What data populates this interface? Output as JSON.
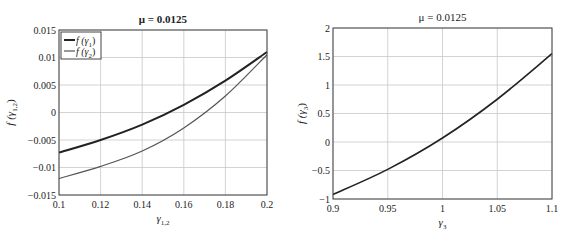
{
  "chart_data": [
    {
      "type": "line",
      "title": "μ = 0.0125",
      "xlabel": "γ1,2",
      "ylabel": "f (γ1,2)",
      "xlim": [
        0.1,
        0.2
      ],
      "ylim": [
        -0.015,
        0.015
      ],
      "grid": true,
      "legend_position": "upper left",
      "x_ticks": [
        "0.1",
        "0.12",
        "0.14",
        "0.16",
        "0.18",
        "0.2"
      ],
      "y_ticks": [
        "0.015",
        "0.01",
        "0.005",
        "0",
        "−0.005",
        "−0.01",
        "−0.015"
      ],
      "x": [
        0.1,
        0.12,
        0.14,
        0.16,
        0.18,
        0.2
      ],
      "series": [
        {
          "name": "f (γ1)",
          "color": "#222222",
          "width": 2,
          "values": [
            -0.0073,
            -0.005,
            -0.0022,
            0.0014,
            0.0058,
            0.011
          ]
        },
        {
          "name": "f (γ2)",
          "color": "#555555",
          "width": 1.2,
          "values": [
            -0.012,
            -0.0098,
            -0.007,
            -0.0028,
            0.003,
            0.0105
          ]
        }
      ]
    },
    {
      "type": "line",
      "title": "μ = 0.0125",
      "xlabel": "γ3",
      "ylabel": "f (γ3)",
      "xlim": [
        0.9,
        1.1
      ],
      "ylim": [
        -1,
        2
      ],
      "grid": true,
      "x_ticks": [
        "0.9",
        "0.95",
        "1",
        "1.05",
        "1.1"
      ],
      "y_ticks": [
        "2",
        "1.5",
        "1",
        "0.5",
        "0",
        "−0.5",
        "−1"
      ],
      "x": [
        0.9,
        0.95,
        1.0,
        1.05,
        1.1
      ],
      "series": [
        {
          "name": "f (γ3)",
          "color": "#222222",
          "width": 1.6,
          "values": [
            -0.92,
            -0.48,
            0.07,
            0.75,
            1.55
          ]
        }
      ]
    }
  ]
}
